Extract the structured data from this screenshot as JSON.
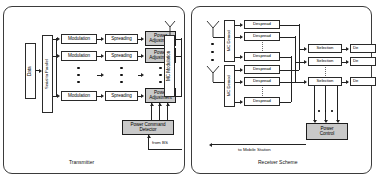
{
  "figure": {
    "panels": [
      "Transmitter",
      "Receiver Scheme"
    ]
  },
  "transmitter": {
    "caption": "Transmitter",
    "data_block": "Data",
    "serial_to_parallel": "Serial to Parallel",
    "modulation_rows": [
      {
        "modulation": "Modulation",
        "spreading": "Spreading",
        "power_adjustment": "Power\nAdjustment"
      },
      {
        "modulation": "Modulation",
        "spreading": "Spreading",
        "power_adjustment": "Power\nAdjustment"
      },
      {
        "modulation": "Modulation",
        "spreading": "Spreading",
        "power_adjustment": "Power\nAdjustment"
      }
    ],
    "modulation_label": "Modulation",
    "spreading_label": "Spreading",
    "power_adjustment_label": "Power Adjustment",
    "power_adjustment_line1": "Power",
    "power_adjustment_line2": "Adjustment",
    "mc_modulation": "MC Modulation",
    "power_command_detector_line1": "Power Command",
    "power_command_detector_line2": "Detector",
    "from_bs": "from BS",
    "antenna": "transmit-antenna"
  },
  "receiver": {
    "caption": "Receiver Scheme",
    "mc_demod": "MC Demod",
    "despread": "Despread",
    "selection": "Selection",
    "decision": "De",
    "power_control_line1": "Power",
    "power_control_line2": "Control",
    "to_mobile_station": "to Mobile Station",
    "branches": [
      {
        "mc_demod": "MC Demod",
        "despread_blocks": [
          "Despread",
          "Despread",
          "Despread"
        ],
        "antenna": "receive-antenna-1"
      },
      {
        "mc_demod": "MC Demod",
        "despread_blocks": [
          "Despread",
          "Despread",
          "Despread"
        ],
        "antenna": "receive-antenna-2"
      }
    ],
    "selection_blocks": [
      "Selection",
      "Selection",
      "Selection"
    ],
    "decision_blocks": [
      "De",
      "De",
      "De"
    ]
  },
  "colors": {
    "shaded_block": "#c9c9c9",
    "line": "#222222",
    "panel_border": "#3b3b3b",
    "background": "#ffffff"
  }
}
